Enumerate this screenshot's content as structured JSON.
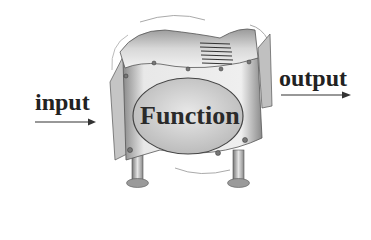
{
  "diagram": {
    "input_label": "input",
    "output_label": "output",
    "function_label": "Function",
    "colors": {
      "text": "#222222",
      "panel_light": "#e6e6e6",
      "panel_mid": "#b5b5b5",
      "panel_dark": "#7a7a7a",
      "ellipse": "#cfcfcf",
      "background": "#ffffff"
    }
  }
}
